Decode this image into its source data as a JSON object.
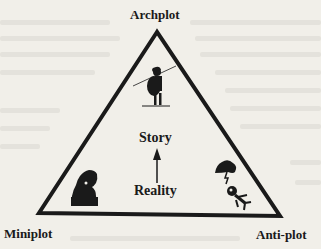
{
  "diagram": {
    "type": "story-triangle",
    "vertices": {
      "top": {
        "label": "Archplot",
        "icon": "warrior-with-spear-and-shield"
      },
      "bottom_left": {
        "label": "Miniplot",
        "icon": "thinker-statue"
      },
      "bottom_right": {
        "label": "Anti-plot",
        "icon": "falling-figure-under-cloud"
      }
    },
    "center": {
      "top_label": "Story",
      "bottom_label": "Reality",
      "arrow_direction": "up"
    },
    "colors": {
      "line": "#1a1a1a",
      "background": "#f1efe9"
    }
  }
}
